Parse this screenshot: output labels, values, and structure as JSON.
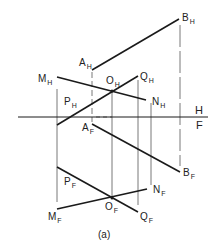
{
  "figure": {
    "caption": "(a)",
    "fold_labels": {
      "top": "H",
      "bottom": "F"
    },
    "points_top_view": {
      "A": {
        "main": "A",
        "sub": "H"
      },
      "B": {
        "main": "B",
        "sub": "H"
      },
      "M": {
        "main": "M",
        "sub": "H"
      },
      "N": {
        "main": "N",
        "sub": "H"
      },
      "O": {
        "main": "O",
        "sub": "H"
      },
      "Q": {
        "main": "Q",
        "sub": "H"
      },
      "P": {
        "main": "P",
        "sub": "H"
      }
    },
    "points_front_view": {
      "A": {
        "main": "A",
        "sub": "F"
      },
      "B": {
        "main": "B",
        "sub": "F"
      },
      "M": {
        "main": "M",
        "sub": "F"
      },
      "N": {
        "main": "N",
        "sub": "F"
      },
      "O": {
        "main": "O",
        "sub": "F"
      },
      "Q": {
        "main": "Q",
        "sub": "F"
      },
      "P": {
        "main": "P",
        "sub": "F"
      }
    },
    "colors": {
      "line": "#1a1a1a",
      "projector": "#555555",
      "background": "#ffffff"
    }
  }
}
